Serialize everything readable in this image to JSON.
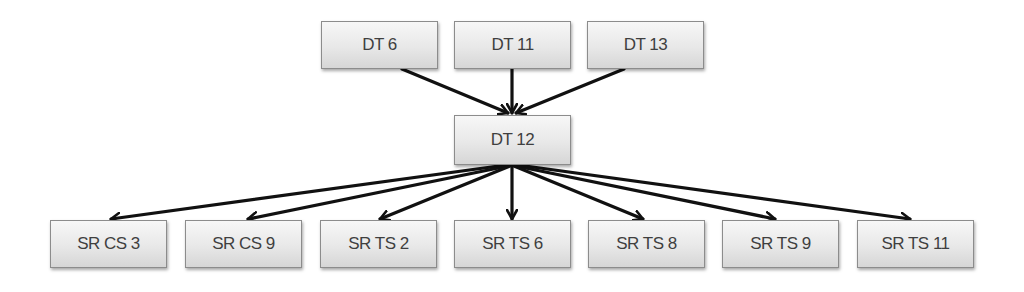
{
  "diagram": {
    "type": "directed-hierarchy",
    "colors": {
      "node_fill_top": "#f7f7f7",
      "node_fill_bottom": "#d6d6d6",
      "node_border": "#8c8c8c",
      "node_text": "#3f3f3f",
      "edge": "#111111",
      "background": "#ffffff"
    },
    "nodes": {
      "top": [
        {
          "id": "dt6",
          "label": "DT 6",
          "x": 321,
          "y": 21
        },
        {
          "id": "dt11",
          "label": "DT 11",
          "x": 454,
          "y": 21
        },
        {
          "id": "dt13",
          "label": "DT 13",
          "x": 587,
          "y": 21
        }
      ],
      "middle": [
        {
          "id": "dt12",
          "label": "DT 12",
          "x": 454,
          "y": 115
        }
      ],
      "bottom": [
        {
          "id": "srcs3",
          "label": "SR CS 3",
          "x": 50,
          "y": 220
        },
        {
          "id": "srcs9",
          "label": "SR CS 9",
          "x": 185,
          "y": 220
        },
        {
          "id": "srts2",
          "label": "SR TS 2",
          "x": 320,
          "y": 220
        },
        {
          "id": "srts6",
          "label": "SR TS 6",
          "x": 454,
          "y": 220
        },
        {
          "id": "srts8",
          "label": "SR TS 8",
          "x": 588,
          "y": 220
        },
        {
          "id": "srts9",
          "label": "SR TS 9",
          "x": 722,
          "y": 220
        },
        {
          "id": "srts11",
          "label": "SR TS 11",
          "x": 857,
          "y": 220
        }
      ]
    },
    "edges": [
      {
        "from": "DT 6",
        "to": "DT 12"
      },
      {
        "from": "DT 11",
        "to": "DT 12"
      },
      {
        "from": "DT 13",
        "to": "DT 12"
      },
      {
        "from": "DT 12",
        "to": "SR CS 3"
      },
      {
        "from": "DT 12",
        "to": "SR CS 9"
      },
      {
        "from": "DT 12",
        "to": "SR TS 2"
      },
      {
        "from": "DT 12",
        "to": "SR TS 6"
      },
      {
        "from": "DT 12",
        "to": "SR TS 8"
      },
      {
        "from": "DT 12",
        "to": "SR TS 9"
      },
      {
        "from": "DT 12",
        "to": "SR TS 11"
      }
    ]
  }
}
